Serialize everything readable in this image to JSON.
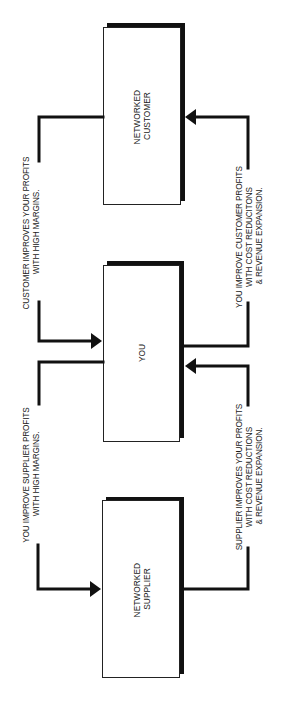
{
  "diagram": {
    "orientation": "rotated-90-ccw",
    "nodes": [
      {
        "id": "customer",
        "label_lines": [
          "NETWORKED",
          "CUSTOMER"
        ]
      },
      {
        "id": "you",
        "label_lines": [
          "YOU"
        ]
      },
      {
        "id": "supplier",
        "label_lines": [
          "NETWORKED",
          "SUPPLIER"
        ]
      }
    ],
    "edges": [
      {
        "id": "customer-to-you",
        "from": "customer",
        "to": "you",
        "label_lines": [
          "CUSTOMER IMPROVES YOUR PROFITS",
          "WITH HIGH MARGINS."
        ]
      },
      {
        "id": "you-to-supplier",
        "from": "you",
        "to": "supplier",
        "label_lines": [
          "YOU IMPROVE SUPPLIER PROFITS",
          "WITH HIGH MARGINS."
        ]
      },
      {
        "id": "you-to-customer",
        "from": "you",
        "to": "customer",
        "label_lines": [
          "YOU IMPROVE CUSTOMER PROFITS",
          "WITH COST REDUCITONS",
          "& REVENUE EXPANSION."
        ]
      },
      {
        "id": "supplier-to-you",
        "from": "supplier",
        "to": "you",
        "label_lines": [
          "SUPPLIER IMPROVES YOUR PROFITS",
          "WITH COST REDUCTIONS",
          "& REVENUE EXPANSION."
        ]
      }
    ]
  },
  "colors": {
    "ink": "#111111",
    "background": "#ffffff"
  }
}
